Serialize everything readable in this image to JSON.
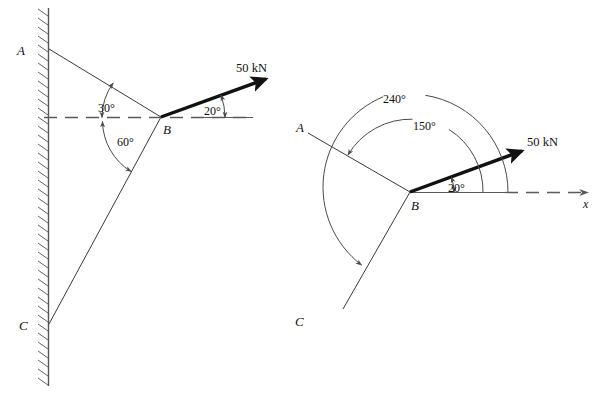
{
  "figure": {
    "background_color": "#ffffff",
    "line_color": "#3a3a3a",
    "force_color": "#111111",
    "panels": [
      {
        "id": "left-panel",
        "name": "wall-mounted-bracket-diagram",
        "points": [
          {
            "label": "A",
            "name": "point-a-label"
          },
          {
            "label": "B",
            "name": "point-b-label"
          },
          {
            "label": "C",
            "name": "point-c-label"
          }
        ],
        "force": {
          "label": "50 kN",
          "magnitude": 50,
          "unit": "kN",
          "angle_from_x_axis_deg": 20
        },
        "angles": [
          {
            "label": "30°",
            "value": 30,
            "name": "angle-30-label",
            "between": "horizontal-dashed-line and member BA"
          },
          {
            "label": "60°",
            "value": 60,
            "name": "angle-60-label",
            "between": "horizontal-dashed-line and member BC"
          },
          {
            "label": "20°",
            "value": 20,
            "name": "angle-20-label",
            "between": "horizontal-dashed-line and 50 kN force"
          }
        ],
        "members": [
          "BA",
          "BC"
        ],
        "support": "hatched vertical wall"
      },
      {
        "id": "right-panel",
        "name": "polar-angle-diagram",
        "points": [
          {
            "label": "A",
            "name": "point-a-label"
          },
          {
            "label": "B",
            "name": "point-b-label"
          },
          {
            "label": "C",
            "name": "point-c-label"
          }
        ],
        "force": {
          "label": "50 kN",
          "magnitude": 50,
          "unit": "kN",
          "angle_from_x_axis_deg": 20
        },
        "axis": {
          "label": "x",
          "name": "x-axis-label"
        },
        "angles": [
          {
            "label": "240°",
            "value": 240,
            "name": "angle-240-label",
            "measured": "from +x axis counterclockwise to member BC"
          },
          {
            "label": "150°",
            "value": 150,
            "name": "angle-150-label",
            "measured": "from +x axis counterclockwise to member BA"
          },
          {
            "label": "20°",
            "value": 20,
            "name": "angle-20-label",
            "measured": "from +x axis counterclockwise to 50 kN force"
          }
        ],
        "members": [
          "BA",
          "BC"
        ]
      }
    ]
  }
}
